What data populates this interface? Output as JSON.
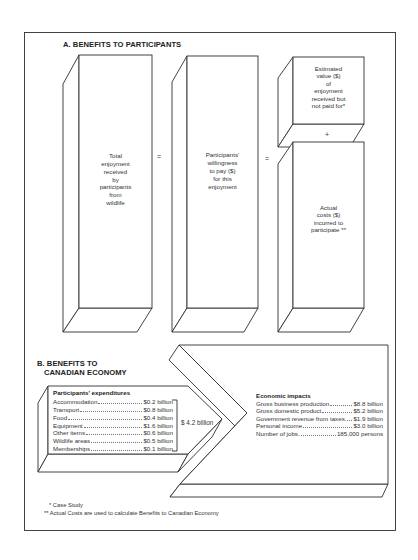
{
  "section_a": {
    "title": "A. BENEFITS TO PARTICIPANTS",
    "boxes": [
      {
        "name": "total-enjoyment",
        "lines": [
          "Total",
          "enjoyment",
          "received",
          "by",
          "participants",
          "from",
          "wildlife"
        ]
      },
      {
        "name": "willingness-to-pay",
        "lines": [
          "Participants'",
          "willingness",
          "to pay ($)",
          "for this",
          "enjoyment"
        ]
      },
      {
        "name": "estimated-value-not-paid",
        "lines": [
          "Estimated",
          "value ($)",
          "of",
          "enjoyment",
          "received but",
          "not paid for*"
        ]
      },
      {
        "name": "actual-costs",
        "lines": [
          "Actual",
          "costs ($)",
          "incurred to",
          "participate **"
        ]
      }
    ],
    "operators": {
      "equals_1": "=",
      "equals_2": "=",
      "plus": "+"
    }
  },
  "section_b": {
    "title_line1": "B. BENEFITS TO",
    "title_line2": "CANADIAN ECONOMY",
    "expenditures": {
      "title": "Participants' expenditures",
      "items": [
        {
          "label": "Accommodation",
          "value": "$0.2 billion"
        },
        {
          "label": "Transport",
          "value": "$0.8 billion"
        },
        {
          "label": "Food",
          "value": "$0.4 billion"
        },
        {
          "label": "Equipment",
          "value": "$1.6 billion"
        },
        {
          "label": "Other items",
          "value": "$0.6 billion"
        },
        {
          "label": "Wildlife areas",
          "value": "$0.5 billion"
        },
        {
          "label": "Memberships",
          "value": "$0.1 billion"
        }
      ],
      "total": "$ 4.2 billion"
    },
    "economic_impacts": {
      "title": "Economic impacts",
      "items": [
        {
          "label": "Gross business production",
          "value": "$8.8 billion"
        },
        {
          "label": "Gross domestic product",
          "value": "$5.2 billion"
        },
        {
          "label": "Government revenue from taxes.",
          "value": "$1.9 billion"
        },
        {
          "label": "Personal income",
          "value": "$3.0 billion"
        },
        {
          "label": "Number of jobs.",
          "value": "185,000 persons"
        }
      ]
    }
  },
  "footnotes": [
    "* Case Study",
    "** Actual Costs are used to calculate Benefits to Canadian Economy"
  ],
  "colors": {
    "line": "#2f2f2f",
    "text": "#2a2a2a",
    "background": "#ffffff"
  }
}
